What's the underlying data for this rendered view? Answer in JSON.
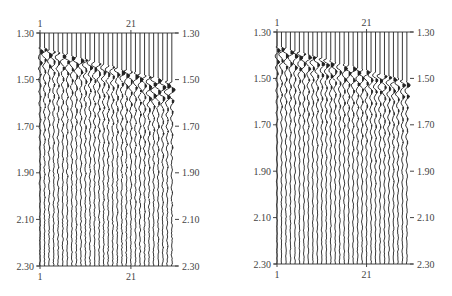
{
  "chart_data": [
    {
      "type": "seismic-wiggle",
      "title": "",
      "xlabel": "",
      "ylabel": "",
      "trace_count": 30,
      "x_ticks_top": [
        "1",
        "21"
      ],
      "x_ticks_bottom": [
        "1",
        "21"
      ],
      "y_ticks_left": [
        "1.30",
        "1.50",
        "1.70",
        "1.90",
        "2.10",
        "2.30"
      ],
      "y_ticks_right": [
        "1.30",
        "1.50",
        "1.70",
        "1.90",
        "2.10",
        "2.30"
      ],
      "ylim": [
        1.3,
        2.3
      ],
      "event": {
        "start_time": 1.38,
        "end_time": 1.53,
        "description": "dipping first-arrival reflection with noisy traces near 25-30"
      },
      "frame": {
        "x0": 40,
        "x1": 175,
        "y0": 33,
        "y1": 266
      },
      "noise_level": 0.9,
      "seed": 7
    },
    {
      "type": "seismic-wiggle",
      "title": "",
      "xlabel": "",
      "ylabel": "",
      "trace_count": 30,
      "x_ticks_top": [
        "1",
        "21"
      ],
      "x_ticks_bottom": [
        "1",
        "21"
      ],
      "y_ticks_left": [
        "1.30",
        "1.50",
        "1.70",
        "1.90",
        "2.10",
        "2.30"
      ],
      "y_ticks_right": [
        "1.30",
        "1.50",
        "1.70",
        "1.90",
        "2.10",
        "2.30"
      ],
      "ylim": [
        1.3,
        2.3
      ],
      "event": {
        "start_time": 1.38,
        "end_time": 1.53,
        "description": "clean dipping reflection with secondary event near 1.57"
      },
      "frame": {
        "x0": 277,
        "x1": 410,
        "y0": 32,
        "y1": 264
      },
      "noise_level": 0.55,
      "seed": 19
    }
  ],
  "colors": {
    "trace": "#222222",
    "axis": "#444444",
    "background": "#ffffff"
  }
}
